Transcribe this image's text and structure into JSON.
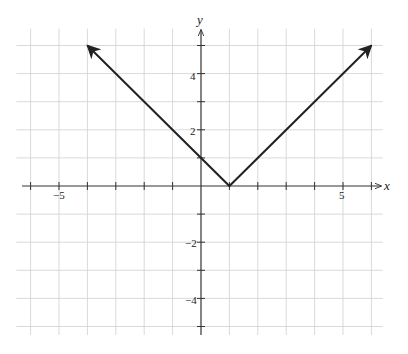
{
  "chart_data": {
    "type": "line",
    "title": "",
    "function": "y = |x - 1|",
    "xlabel": "x",
    "ylabel": "y",
    "xlim": [
      -6.5,
      6.4
    ],
    "ylim": [
      -5.3,
      5.6
    ],
    "grid": true,
    "x_ticks": [
      -6,
      -5,
      -4,
      -3,
      -2,
      -1,
      1,
      2,
      3,
      4,
      5,
      6
    ],
    "y_ticks": [
      -5,
      -4,
      -3,
      -2,
      -1,
      1,
      2,
      3,
      4,
      5
    ],
    "x_tick_labels": [
      {
        "value": -5,
        "label": "−5"
      },
      {
        "value": 5,
        "label": "5"
      }
    ],
    "y_tick_labels": [
      {
        "value": 4,
        "label": "4"
      },
      {
        "value": 2,
        "label": "2"
      },
      {
        "value": -2,
        "label": "−2"
      },
      {
        "value": -4,
        "label": "−4"
      }
    ],
    "series": [
      {
        "name": "y = |x − 1|",
        "x": [
          -4,
          1,
          6
        ],
        "y": [
          5,
          0,
          5
        ],
        "arrows_at_ends": true,
        "color": "#222222"
      }
    ]
  },
  "labels": {
    "x_axis": "x",
    "y_axis": "y",
    "xm5": "−5",
    "x5": "5",
    "y4": "4",
    "y2": "2",
    "ym2": "−2",
    "ym4": "−4"
  }
}
